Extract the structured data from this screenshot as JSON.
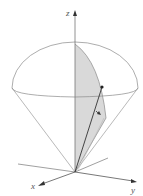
{
  "diagram": {
    "type": "3d-coordinate-figure",
    "axes": {
      "x_label": "x",
      "y_label": "y",
      "z_label": "z"
    },
    "colors": {
      "stroke": "#8a8a8a",
      "axis": "#555555",
      "shade": "#d9d9d9",
      "vector": "#333333"
    }
  }
}
